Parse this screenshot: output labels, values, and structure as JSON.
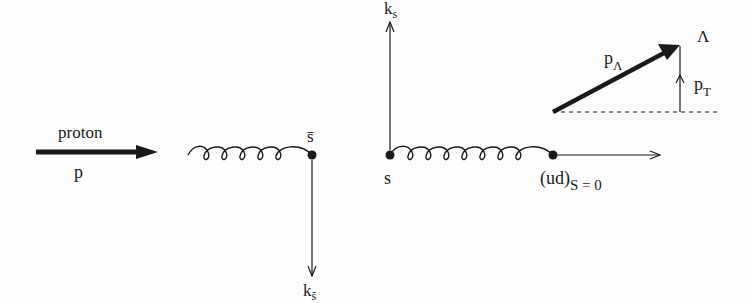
{
  "figure": {
    "ink_color": "#1a1a1a",
    "background_color": "#fdfdfd"
  },
  "proton": {
    "label_top": "proton",
    "label_bottom": "p"
  },
  "left_pair": {
    "quark_label": "s̄",
    "momentum_label_base": "k",
    "momentum_label_sub": "s̄"
  },
  "right_pair": {
    "quark_label": "s",
    "momentum_label_base": "k",
    "momentum_label_sub": "s",
    "diquark_label": "(ud)",
    "diquark_sub": "S = 0"
  },
  "lambda": {
    "label": "Λ",
    "momentum_base": "p",
    "momentum_sub": "Λ",
    "transverse_base": "p",
    "transverse_sub": "T"
  }
}
